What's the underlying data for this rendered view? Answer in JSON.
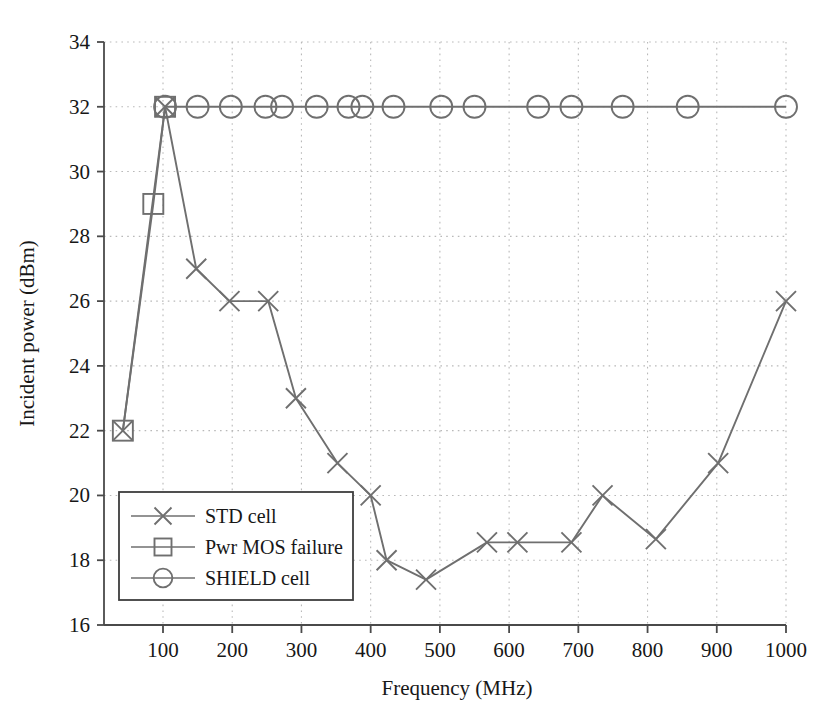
{
  "chart_data": {
    "type": "line",
    "title": "",
    "xlabel": "Frequency (MHz)",
    "ylabel": "Incident power (dBm)",
    "xlim": [
      40,
      1000
    ],
    "ylim": [
      16,
      34
    ],
    "xticks": [
      100,
      200,
      300,
      400,
      500,
      600,
      700,
      800,
      900,
      1000
    ],
    "xtick_labels": [
      "100",
      "200",
      "300",
      "400",
      "500",
      "600",
      "700",
      "800",
      "900",
      "1000"
    ],
    "yticks": [
      16,
      18,
      20,
      22,
      24,
      26,
      28,
      30,
      32,
      34
    ],
    "ytick_labels": [
      "16",
      "18",
      "20",
      "22",
      "24",
      "26",
      "28",
      "30",
      "32",
      "34"
    ],
    "grid": true,
    "grid_style": "dotted",
    "legend_position": "lower left",
    "line_color": "#6f6f6f",
    "grid_color": "#b9b9b9",
    "axis_color": "#4a4a4a",
    "series": [
      {
        "name": "STD cell",
        "marker": "x",
        "points": [
          [
            42,
            22.0
          ],
          [
            103,
            32.0
          ],
          [
            148,
            27.0
          ],
          [
            196,
            26.0
          ],
          [
            252,
            26.0
          ],
          [
            292,
            23.0
          ],
          [
            352,
            21.0
          ],
          [
            400,
            20.0
          ],
          [
            423,
            18.0
          ],
          [
            480,
            17.4
          ],
          [
            568,
            18.55
          ],
          [
            612,
            18.55
          ],
          [
            690,
            18.55
          ],
          [
            735,
            20.0
          ],
          [
            812,
            18.65
          ],
          [
            902,
            21.0
          ],
          [
            1000,
            26.0
          ]
        ]
      },
      {
        "name": "Pwr MOS failure",
        "marker": "square",
        "points": [
          [
            42,
            22.0
          ],
          [
            86,
            29.0
          ],
          [
            103,
            32.0
          ]
        ]
      },
      {
        "name": "SHIELD cell",
        "marker": "circle",
        "points": [
          [
            103,
            32.0
          ],
          [
            150,
            32.0
          ],
          [
            198,
            32.0
          ],
          [
            248,
            32.0
          ],
          [
            272,
            32.0
          ],
          [
            322,
            32.0
          ],
          [
            368,
            32.0
          ],
          [
            388,
            32.0
          ],
          [
            433,
            32.0
          ],
          [
            502,
            32.0
          ],
          [
            550,
            32.0
          ],
          [
            642,
            32.0
          ],
          [
            690,
            32.0
          ],
          [
            764,
            32.0
          ],
          [
            858,
            32.0
          ],
          [
            1000,
            32.0
          ]
        ]
      }
    ],
    "legend_entries": [
      {
        "label": "STD cell",
        "marker": "x"
      },
      {
        "label": "Pwr MOS failure",
        "marker": "square"
      },
      {
        "label": "SHIELD cell",
        "marker": "circle"
      }
    ]
  }
}
